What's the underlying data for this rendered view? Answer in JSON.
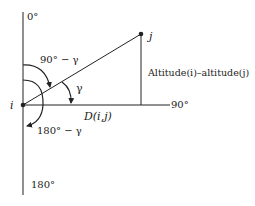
{
  "diagram": {
    "labels": {
      "top_axis": "0°",
      "bottom_axis": "180°",
      "right_axis": "90°",
      "point_i": "i",
      "point_j": "j",
      "angle_gamma": "γ",
      "angle_90_minus_gamma": "90° − γ",
      "angle_180_minus_gamma": "180° − γ",
      "distance": "D(i,j)",
      "altitude_difference": "Altitude(i)–altitude(j)"
    },
    "colors": {
      "stroke": "#222222",
      "background": "#ffffff"
    }
  }
}
